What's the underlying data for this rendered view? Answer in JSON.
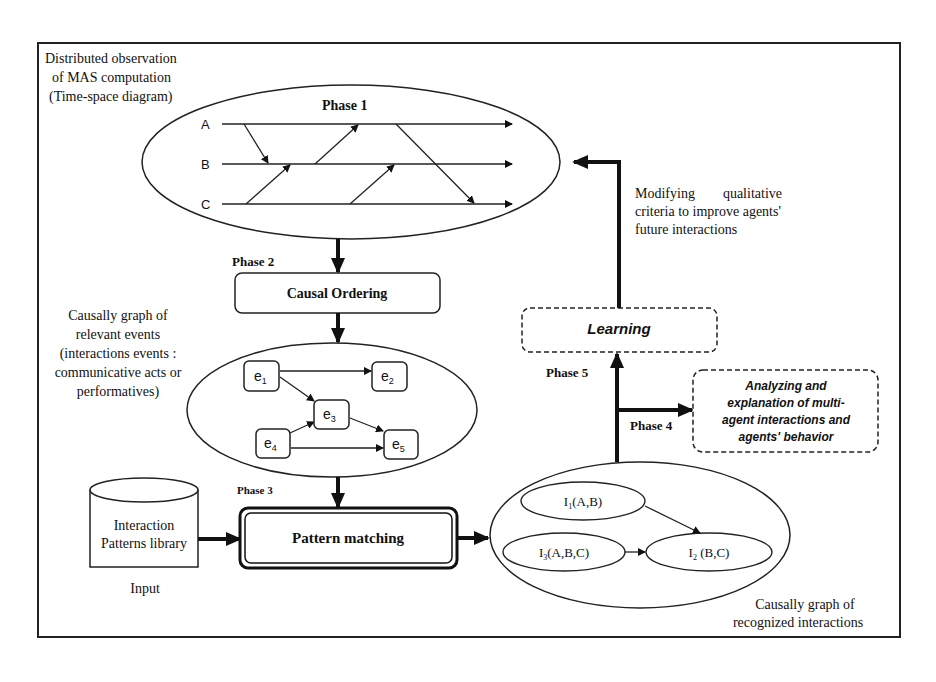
{
  "diagram": {
    "top_left_label": [
      "Distributed observation",
      "of MAS computation",
      "(Time-space diagram)"
    ],
    "phase1": {
      "label": "Phase 1",
      "lanes": [
        "A",
        "B",
        "C"
      ]
    },
    "phase2": {
      "label": "Phase 2",
      "box": "Causal Ordering"
    },
    "event_graph_label": [
      "Causally graph of",
      "relevant events",
      "(interactions events :",
      "communicative acts or",
      "performatives)"
    ],
    "event_nodes": [
      {
        "base": "e",
        "sub": "1"
      },
      {
        "base": "e",
        "sub": "2"
      },
      {
        "base": "e",
        "sub": "3"
      },
      {
        "base": "e",
        "sub": "4"
      },
      {
        "base": "e",
        "sub": "5"
      }
    ],
    "phase3": {
      "label": "Phase 3",
      "box": "Pattern matching"
    },
    "library": {
      "lines": [
        "Interaction",
        "Patterns library"
      ],
      "caption": "Input"
    },
    "interaction_nodes": [
      {
        "base": "I",
        "sub": "1",
        "args": "(A,B)"
      },
      {
        "base": "I",
        "sub": "3",
        "args": "(A,B,C)"
      },
      {
        "base": "I",
        "sub": "2",
        "args": " (B,C)"
      }
    ],
    "interaction_graph_label": [
      "Causally graph of",
      "recognized interactions"
    ],
    "phase4": {
      "label": "Phase 4",
      "box": [
        "Analyzing and",
        "explanation of multi-",
        "agent interactions and",
        "agents' behavior"
      ]
    },
    "phase5": {
      "label": "Phase 5",
      "box": "Learning"
    },
    "feedback_label": [
      "Modifying        qualitative",
      "criteria to improve agents'",
      "future interactions"
    ]
  }
}
